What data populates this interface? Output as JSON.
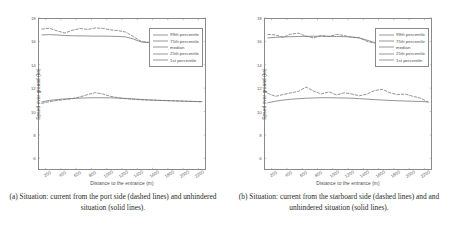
{
  "figure": {
    "panels": [
      {
        "id": "a",
        "caption": "(a) Situation: current from the port side (dashed lines) and unhindered situation (solid lines).",
        "chart_data": {
          "type": "line",
          "title": "",
          "xlabel": "Distance to the entrance (m)",
          "ylabel": "Speed over ground (kn)",
          "xlim": [
            100,
            2300
          ],
          "ylim": [
            5,
            18
          ],
          "xticks": [
            200,
            400,
            600,
            800,
            1000,
            1200,
            1400,
            1600,
            1800,
            2000,
            2200
          ],
          "yticks": [
            6,
            8,
            10,
            12,
            14,
            16,
            18
          ],
          "grid": false,
          "legend_position": "top-right",
          "legend": [
            "99th percentile",
            "75th percentile",
            "median",
            "25th percentile",
            "1st percentile"
          ],
          "x": [
            150,
            250,
            350,
            450,
            550,
            650,
            750,
            850,
            950,
            1050,
            1150,
            1250,
            1350,
            1450,
            1550,
            1650,
            1750,
            1850,
            1950,
            2050,
            2150,
            2250
          ],
          "series": [
            {
              "name": "99th percentile (unhindered)",
              "style": "solid",
              "values": [
                16.55,
                16.58,
                16.55,
                16.5,
                16.48,
                16.47,
                16.46,
                16.45,
                16.45,
                16.44,
                16.42,
                16.38,
                16.2,
                15.95,
                15.9,
                15.88,
                15.87,
                15.86,
                15.85,
                15.84,
                15.83,
                15.82
              ]
            },
            {
              "name": "99th percentile (current from port side)",
              "style": "dashed",
              "values": [
                17.05,
                17.12,
                16.9,
                16.72,
                16.95,
                17.1,
                17.02,
                17.15,
                17.12,
                16.98,
                16.92,
                16.8,
                16.4,
                16.0,
                15.92,
                15.88,
                15.86,
                15.85,
                15.84,
                15.83,
                15.82,
                15.8
              ]
            },
            {
              "name": "25th percentile (unhindered)",
              "style": "solid",
              "values": [
                10.82,
                10.95,
                11.02,
                11.08,
                11.12,
                11.15,
                11.17,
                11.18,
                11.18,
                11.17,
                11.15,
                11.12,
                11.08,
                11.04,
                11.0,
                10.97,
                10.94,
                10.92,
                10.9,
                10.88,
                10.86,
                10.84
              ]
            },
            {
              "name": "25th percentile (current from port side)",
              "style": "dashed",
              "values": [
                10.7,
                10.85,
                10.95,
                11.02,
                11.1,
                11.25,
                11.45,
                11.62,
                11.5,
                11.3,
                11.18,
                11.1,
                11.05,
                11.0,
                10.98,
                10.96,
                10.94,
                10.92,
                10.9,
                10.88,
                10.86,
                10.84
              ]
            }
          ]
        }
      },
      {
        "id": "b",
        "caption": "(b) Situation: current from the starboard side (dashed lines) and and unhindered situation (solid lines).",
        "chart_data": {
          "type": "line",
          "title": "",
          "xlabel": "Distance to the entrance (m)",
          "ylabel": "Speed over ground (kn)",
          "xlim": [
            100,
            2300
          ],
          "ylim": [
            5,
            18
          ],
          "xticks": [
            200,
            400,
            600,
            800,
            1000,
            1200,
            1400,
            1600,
            1800,
            2000,
            2200
          ],
          "yticks": [
            6,
            8,
            10,
            12,
            14,
            16,
            18
          ],
          "grid": false,
          "legend_position": "top-right",
          "legend": [
            "99th percentile",
            "75th percentile",
            "median",
            "25th percentile",
            "1st percentile"
          ],
          "x": [
            150,
            250,
            350,
            450,
            550,
            650,
            750,
            850,
            950,
            1050,
            1150,
            1250,
            1350,
            1450,
            1550,
            1650,
            1750,
            1850,
            1950,
            2050,
            2150,
            2250
          ],
          "series": [
            {
              "name": "99th percentile (unhindered)",
              "style": "solid",
              "values": [
                16.3,
                16.35,
                16.38,
                16.4,
                16.42,
                16.43,
                16.44,
                16.44,
                16.43,
                16.42,
                16.4,
                16.38,
                16.3,
                16.1,
                15.9,
                15.88,
                15.87,
                15.86,
                15.85,
                15.84,
                15.83,
                15.82
              ]
            },
            {
              "name": "99th percentile (current from starboard side)",
              "style": "dashed",
              "values": [
                16.6,
                16.55,
                16.35,
                16.62,
                16.7,
                16.45,
                16.3,
                16.5,
                16.42,
                16.6,
                16.5,
                16.35,
                16.3,
                16.0,
                15.85,
                15.9,
                15.88,
                15.86,
                15.85,
                15.84,
                15.83,
                15.8
              ]
            },
            {
              "name": "25th percentile (unhindered)",
              "style": "solid",
              "values": [
                10.75,
                10.88,
                10.98,
                11.05,
                11.1,
                11.14,
                11.16,
                11.18,
                11.18,
                11.17,
                11.16,
                11.14,
                11.1,
                11.06,
                11.02,
                10.98,
                10.95,
                10.92,
                10.9,
                10.88,
                10.86,
                10.82
              ]
            },
            {
              "name": "25th percentile (current from starboard side)",
              "style": "dashed",
              "values": [
                11.55,
                11.3,
                11.45,
                11.6,
                11.72,
                12.1,
                11.75,
                11.5,
                11.68,
                11.42,
                11.6,
                11.5,
                11.35,
                11.5,
                11.8,
                11.9,
                11.6,
                11.45,
                11.5,
                11.3,
                11.15,
                10.8
              ]
            }
          ]
        }
      }
    ]
  }
}
